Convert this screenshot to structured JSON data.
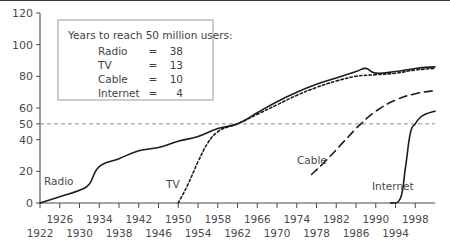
{
  "chart_data": {
    "type": "line",
    "title": "",
    "xlabel": "",
    "ylabel": "",
    "xlim": [
      1922,
      2002
    ],
    "ylim": [
      0,
      120
    ],
    "grid": false,
    "legend_position": "inside-top-left",
    "yticks": [
      0,
      20,
      40,
      50,
      60,
      80,
      100,
      120
    ],
    "xticks": [
      1922,
      1926,
      1930,
      1934,
      1938,
      1942,
      1946,
      1950,
      1954,
      1958,
      1962,
      1966,
      1970,
      1974,
      1978,
      1982,
      1986,
      1990,
      1994,
      1998
    ],
    "xticks_row_upper": [
      1926,
      1934,
      1942,
      1950,
      1958,
      1966,
      1974,
      1982,
      1990,
      1998
    ],
    "xticks_row_lower": [
      1922,
      1930,
      1938,
      1946,
      1954,
      1962,
      1970,
      1978,
      1986,
      1994
    ],
    "threshold": {
      "value": 50,
      "style": "dashed",
      "label": ""
    },
    "series": [
      {
        "name": "Radio",
        "style": "solid",
        "label": "Radio",
        "points": [
          [
            1922,
            0
          ],
          [
            1926,
            4
          ],
          [
            1930,
            8
          ],
          [
            1932,
            12
          ],
          [
            1934,
            23
          ],
          [
            1938,
            28
          ],
          [
            1942,
            33
          ],
          [
            1946,
            35
          ],
          [
            1950,
            39
          ],
          [
            1954,
            42
          ],
          [
            1958,
            47
          ],
          [
            1962,
            50
          ],
          [
            1966,
            57
          ],
          [
            1970,
            64
          ],
          [
            1974,
            70
          ],
          [
            1978,
            75
          ],
          [
            1982,
            79
          ],
          [
            1986,
            83
          ],
          [
            1988,
            85
          ],
          [
            1990,
            82
          ],
          [
            1994,
            83
          ],
          [
            1998,
            85
          ],
          [
            2002,
            86
          ]
        ]
      },
      {
        "name": "TV",
        "style": "dotted",
        "label": "TV",
        "points": [
          [
            1950,
            0
          ],
          [
            1952,
            12
          ],
          [
            1954,
            26
          ],
          [
            1956,
            38
          ],
          [
            1958,
            45
          ],
          [
            1960,
            48
          ],
          [
            1962,
            50
          ],
          [
            1966,
            56
          ],
          [
            1970,
            62
          ],
          [
            1974,
            68
          ],
          [
            1978,
            73
          ],
          [
            1982,
            77
          ],
          [
            1986,
            80
          ],
          [
            1990,
            81
          ],
          [
            1994,
            82
          ],
          [
            1998,
            84
          ],
          [
            2002,
            85
          ]
        ]
      },
      {
        "name": "Cable",
        "style": "dashed",
        "label": "Cable",
        "points": [
          [
            1977,
            18
          ],
          [
            1980,
            27
          ],
          [
            1983,
            37
          ],
          [
            1986,
            47
          ],
          [
            1987,
            50
          ],
          [
            1990,
            58
          ],
          [
            1994,
            65
          ],
          [
            1998,
            69
          ],
          [
            2002,
            71
          ]
        ]
      },
      {
        "name": "Internet",
        "style": "solid",
        "label": "Internet",
        "points": [
          [
            1993,
            0
          ],
          [
            1995,
            3
          ],
          [
            1996,
            22
          ],
          [
            1997,
            44
          ],
          [
            1998,
            50
          ],
          [
            1999,
            54
          ],
          [
            2000,
            56
          ],
          [
            2002,
            58
          ]
        ]
      }
    ]
  },
  "legend": {
    "title": "Years to reach 50 million users:",
    "rows": [
      {
        "medium": "Radio",
        "eq": "=",
        "years": "38"
      },
      {
        "medium": "TV",
        "eq": "=",
        "years": "13"
      },
      {
        "medium": "Cable",
        "eq": "=",
        "years": "10"
      },
      {
        "medium": "Internet",
        "eq": "=",
        "years": "4"
      }
    ]
  },
  "colors": {
    "ink": "#1c1c1c",
    "axis": "#4a4a4a",
    "threshold": "#8c8c8c",
    "legend_border": "#9a9a9a",
    "background": "#ffffff"
  }
}
